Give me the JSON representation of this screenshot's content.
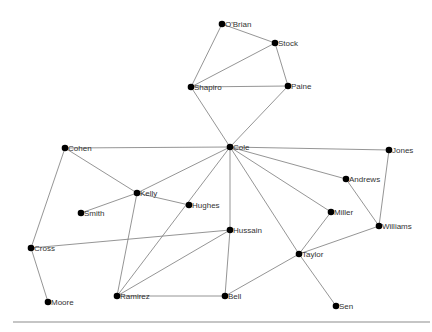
{
  "diagram": {
    "type": "network",
    "nodes": [
      {
        "id": "O'Brian",
        "label": "O'Brian",
        "x": 222,
        "y": 24
      },
      {
        "id": "Stock",
        "label": "Stock",
        "x": 275,
        "y": 43
      },
      {
        "id": "Shapiro",
        "label": "Shapiro",
        "x": 191,
        "y": 87
      },
      {
        "id": "Paine",
        "label": "Paine",
        "x": 288,
        "y": 86
      },
      {
        "id": "Cole",
        "label": "Cole",
        "x": 230,
        "y": 147
      },
      {
        "id": "Cohen",
        "label": "Cohen",
        "x": 65,
        "y": 148
      },
      {
        "id": "Jones",
        "label": "Jones",
        "x": 389,
        "y": 150
      },
      {
        "id": "Kelly",
        "label": "Kelly",
        "x": 137,
        "y": 193
      },
      {
        "id": "Hughes",
        "label": "Hughes",
        "x": 189,
        "y": 205
      },
      {
        "id": "Smith",
        "label": "Smith",
        "x": 81,
        "y": 213
      },
      {
        "id": "Andrews",
        "label": "Andrews",
        "x": 346,
        "y": 179
      },
      {
        "id": "Miller",
        "label": "Miller",
        "x": 331,
        "y": 212
      },
      {
        "id": "Williams",
        "label": "Williams",
        "x": 379,
        "y": 226
      },
      {
        "id": "Hussain",
        "label": "Hussain",
        "x": 230,
        "y": 230
      },
      {
        "id": "Cross",
        "label": "Cross",
        "x": 31,
        "y": 248
      },
      {
        "id": "Taylor",
        "label": "Taylor",
        "x": 299,
        "y": 254
      },
      {
        "id": "Ramirez",
        "label": "Ramirez",
        "x": 117,
        "y": 296
      },
      {
        "id": "Bell",
        "label": "Bell",
        "x": 225,
        "y": 296
      },
      {
        "id": "Moore",
        "label": "Moore",
        "x": 48,
        "y": 302
      },
      {
        "id": "Sen",
        "label": "Sen",
        "x": 336,
        "y": 306
      }
    ],
    "edges": [
      [
        "O'Brian",
        "Stock"
      ],
      [
        "O'Brian",
        "Shapiro"
      ],
      [
        "Stock",
        "Shapiro"
      ],
      [
        "Stock",
        "Paine"
      ],
      [
        "Shapiro",
        "Paine"
      ],
      [
        "Shapiro",
        "Cole"
      ],
      [
        "Paine",
        "Cole"
      ],
      [
        "Cole",
        "Cohen"
      ],
      [
        "Cole",
        "Jones"
      ],
      [
        "Cole",
        "Kelly"
      ],
      [
        "Cole",
        "Andrews"
      ],
      [
        "Cole",
        "Miller"
      ],
      [
        "Cole",
        "Taylor"
      ],
      [
        "Cole",
        "Hussain"
      ],
      [
        "Cole",
        "Ramirez"
      ],
      [
        "Cohen",
        "Kelly"
      ],
      [
        "Cohen",
        "Cross"
      ],
      [
        "Kelly",
        "Hughes"
      ],
      [
        "Kelly",
        "Smith"
      ],
      [
        "Kelly",
        "Ramirez"
      ],
      [
        "Jones",
        "Williams"
      ],
      [
        "Andrews",
        "Williams"
      ],
      [
        "Miller",
        "Taylor"
      ],
      [
        "Williams",
        "Taylor"
      ],
      [
        "Taylor",
        "Bell"
      ],
      [
        "Taylor",
        "Sen"
      ],
      [
        "Hussain",
        "Cross"
      ],
      [
        "Hussain",
        "Ramirez"
      ],
      [
        "Hussain",
        "Bell"
      ],
      [
        "Ramirez",
        "Bell"
      ],
      [
        "Cross",
        "Moore"
      ]
    ],
    "baseline": {
      "x1": 13,
      "y1": 322,
      "x2": 430,
      "y2": 322
    },
    "colors": {
      "node": "#000000",
      "edge": "#7a7a7a",
      "label": "#333333",
      "baseline": "#8c8c8c"
    }
  }
}
